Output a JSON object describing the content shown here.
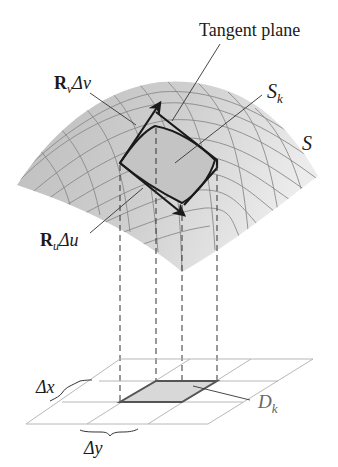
{
  "figure": {
    "labels": {
      "tangent_plane": "Tangent plane",
      "r_v_bold": "R",
      "r_v_sub": "v",
      "r_v_delta": "Δv",
      "r_u_bold": "R",
      "r_u_sub": "u",
      "r_u_delta": "Δu",
      "s_k_main": "S",
      "s_k_sub": "k",
      "s": "S",
      "d_k_main": "D",
      "d_k_sub": "k",
      "delta_x": "Δx",
      "delta_y": "Δy"
    },
    "colors": {
      "surface_fill": "#d4d4d4",
      "surface_grid": "#8a8a8a",
      "patch_fill": "#c2c2c2",
      "outline": "#1a1a1a",
      "base_grid": "#b0b0b0",
      "dk_fill": "#d8d8d8",
      "leader": "#333333"
    }
  }
}
